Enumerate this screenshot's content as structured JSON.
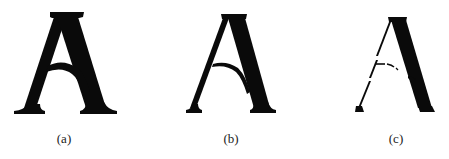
{
  "figure": {
    "panels": [
      {
        "id": "a",
        "caption": "(a)",
        "description": "Original bold serif letter A"
      },
      {
        "id": "b",
        "caption": "(b)",
        "description": "Thinned serif letter A"
      },
      {
        "id": "c",
        "caption": "(c)",
        "description": "Letter A with thin dashed left stroke and crossbar, thick right stroke"
      }
    ],
    "colors": {
      "glyph": "#0a0a0a",
      "background": "#ffffff",
      "caption": "#222222"
    }
  }
}
